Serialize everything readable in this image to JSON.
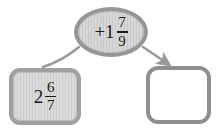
{
  "diagram": {
    "type": "function-machine",
    "title": "",
    "background_color": "#ffffff",
    "input_box": {
      "label": "2 6/7",
      "whole": "2",
      "numerator": "6",
      "denominator": "7",
      "fill_color": "#cccccc",
      "border_color": "#a0a0a0"
    },
    "operator_oval": {
      "label": "+1 7/9",
      "sign": "+",
      "whole": "1",
      "numerator": "7",
      "denominator": "9",
      "fill_color": "#c9c9c9",
      "border_color": "#969696"
    },
    "output_box": {
      "label": "",
      "fill_color": "#ffffff",
      "border_color": "#8f8f8f"
    },
    "connectors": {
      "left_curve": {
        "name": "input-to-operator-curve",
        "has_arrowhead": false,
        "color": "#9a9a9a"
      },
      "right_curve": {
        "name": "operator-to-output-arrow",
        "has_arrowhead": true,
        "color": "#9a9a9a"
      }
    }
  }
}
